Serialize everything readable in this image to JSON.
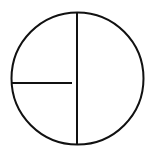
{
  "diagram": {
    "stroke_color": "#111111",
    "background": "#ffffff",
    "circle": {
      "cx": 77.5,
      "cy": 78.5,
      "r": 66
    },
    "vertical_line": {
      "x1": 77,
      "y1": 12.5,
      "x2": 77,
      "y2": 144.5
    },
    "horizontal_line": {
      "x1": 11.5,
      "y1": 83,
      "x2": 72,
      "y2": 83
    }
  }
}
